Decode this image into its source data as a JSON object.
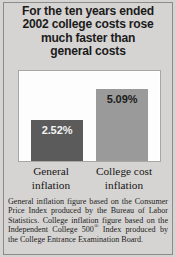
{
  "headline": {
    "lines": [
      "For the ten years ended",
      "2002 college costs rose",
      "much faster than",
      "general costs"
    ]
  },
  "chart_data": {
    "type": "bar",
    "title": "For the ten years ended 2002 college costs rose much faster than general costs",
    "categories": [
      "General inflation",
      "College cost inflation"
    ],
    "values": [
      2.52,
      5.09
    ],
    "value_labels": [
      "2.52%",
      "5.09%"
    ],
    "units": "percent",
    "xlabel": "",
    "ylabel": "",
    "ylim": [
      0,
      6.5
    ],
    "grid": false,
    "legend": "none",
    "series": [
      {
        "name": "Annualized inflation rate",
        "values": [
          2.52,
          5.09
        ],
        "colors": [
          "#5b5b5b",
          "#9a9a9a"
        ]
      }
    ]
  },
  "categories": {
    "general": {
      "line1": "General",
      "line2": "inflation"
    },
    "college": {
      "line1": "College cost",
      "line2": "inflation"
    }
  },
  "values": {
    "general": "2.52%",
    "college": "5.09%"
  },
  "footnote": {
    "part1": "General inflation figure based on the Consumer Price Index produced by the Bureau of Labor Statistics. College inflation figure based on the Independent College 500",
    "mark": "®",
    "part2": " Index produced by the College Entrance Examination Board."
  },
  "colors": {
    "background": "#d6d4d2",
    "plot_background": "#fdfdfd",
    "bar_general": "#5b5b5b",
    "bar_college": "#9a9a9a",
    "text": "#1b1b1b"
  }
}
